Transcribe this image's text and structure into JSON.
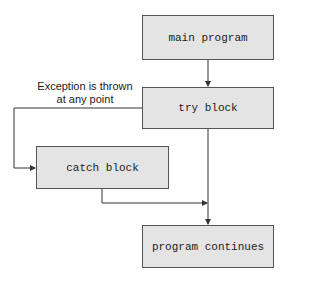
{
  "diagram": {
    "type": "flowchart",
    "nodes": [
      {
        "id": "main",
        "label": "main program"
      },
      {
        "id": "try",
        "label": "try block"
      },
      {
        "id": "catch",
        "label": "catch block"
      },
      {
        "id": "continue",
        "label": "program continues"
      }
    ],
    "edges": [
      {
        "from": "main",
        "to": "try"
      },
      {
        "from": "try",
        "to": "catch",
        "label": "Exception is thrown at any point"
      },
      {
        "from": "try",
        "to": "continue"
      },
      {
        "from": "catch",
        "to": "continue"
      }
    ],
    "exception_label_line1": "Exception is thrown",
    "exception_label_line2": "at any point",
    "colors": {
      "box_fill": "#e4e4e4",
      "box_border": "#555555",
      "line": "#333333"
    }
  }
}
